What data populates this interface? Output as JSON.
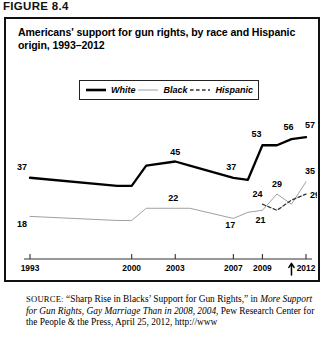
{
  "figure": {
    "label": "FIGURE 8.4",
    "title": "Americans' support for gun rights, by race and Hispanic origin, 1993–2012"
  },
  "legend": {
    "items": [
      {
        "label": "White",
        "style": "solid-thick",
        "color": "#000000"
      },
      {
        "label": "Black",
        "style": "solid-thin",
        "color": "#9a9a9a"
      },
      {
        "label": "Hispanic",
        "style": "dashed",
        "color": "#444444"
      }
    ]
  },
  "axis": {
    "ticks": [
      "1993",
      "2000",
      "2003",
      "2007",
      "2009",
      "2012"
    ],
    "annotation_year": "2011"
  },
  "source": {
    "prefix": "SOURCE:",
    "line1_a": " “Sharp Rise in Blacks’ Support for Gun Rights,” in ",
    "line1_i": "More",
    "line2_i": "Support for Gun Rights, Gay Marriage Than in 2008, 2004",
    "line2_a": ", Pew",
    "line3": "Research Center for the People & the Press, April 25, 2012, http://www"
  },
  "chart_data": {
    "type": "line",
    "title": "Americans' support for gun rights, by race and Hispanic origin, 1993–2012",
    "xlabel": "",
    "ylabel": "",
    "grid": false,
    "legend_position": "top-center",
    "x": [
      "1993",
      "2000",
      "2003",
      "2007",
      "2009",
      "2012"
    ],
    "xlim": [
      "1993",
      "2012"
    ],
    "ylim": [
      0,
      60
    ],
    "series": [
      {
        "name": "White",
        "style": "solid-thick",
        "color": "#000000",
        "points": [
          {
            "year": 1993,
            "value": 37,
            "labeled": true,
            "label": "37"
          },
          {
            "year": 1999,
            "value": 33,
            "labeled": false,
            "label": ""
          },
          {
            "year": 2000,
            "value": 33,
            "labeled": false,
            "label": ""
          },
          {
            "year": 2001,
            "value": 43,
            "labeled": false,
            "label": ""
          },
          {
            "year": 2003,
            "value": 45,
            "labeled": true,
            "label": "45"
          },
          {
            "year": 2004,
            "value": 43,
            "labeled": false,
            "label": ""
          },
          {
            "year": 2007,
            "value": 37,
            "labeled": true,
            "label": "37"
          },
          {
            "year": 2008,
            "value": 36,
            "labeled": false,
            "label": ""
          },
          {
            "year": 2009,
            "value": 53,
            "labeled": true,
            "label": "53"
          },
          {
            "year": 2010,
            "value": 53,
            "labeled": false,
            "label": ""
          },
          {
            "year": 2011,
            "value": 56,
            "labeled": true,
            "label": "56"
          },
          {
            "year": 2012,
            "value": 57,
            "labeled": true,
            "label": "57"
          }
        ]
      },
      {
        "name": "Black",
        "style": "solid-thin",
        "color": "#9a9a9a",
        "points": [
          {
            "year": 1993,
            "value": 18,
            "labeled": true,
            "label": "18"
          },
          {
            "year": 1999,
            "value": 16,
            "labeled": false,
            "label": ""
          },
          {
            "year": 2000,
            "value": 16,
            "labeled": false,
            "label": ""
          },
          {
            "year": 2001,
            "value": 22,
            "labeled": false,
            "label": ""
          },
          {
            "year": 2003,
            "value": 22,
            "labeled": true,
            "label": "22"
          },
          {
            "year": 2004,
            "value": 22,
            "labeled": false,
            "label": ""
          },
          {
            "year": 2007,
            "value": 17,
            "labeled": true,
            "label": "17"
          },
          {
            "year": 2008,
            "value": 20,
            "labeled": false,
            "label": ""
          },
          {
            "year": 2009,
            "value": 21,
            "labeled": true,
            "label": "21"
          },
          {
            "year": 2010,
            "value": 29,
            "labeled": true,
            "label": "29"
          },
          {
            "year": 2011,
            "value": 24,
            "labeled": false,
            "label": ""
          },
          {
            "year": 2012,
            "value": 35,
            "labeled": true,
            "label": "35"
          }
        ]
      },
      {
        "name": "Hispanic",
        "style": "dashed",
        "color": "#444444",
        "points": [
          {
            "year": 2009,
            "value": 24,
            "labeled": true,
            "label": "24"
          },
          {
            "year": 2010,
            "value": 21,
            "labeled": false,
            "label": ""
          },
          {
            "year": 2011,
            "value": 26,
            "labeled": false,
            "label": ""
          },
          {
            "year": 2012,
            "value": 29,
            "labeled": true,
            "label": "29"
          }
        ]
      }
    ]
  }
}
